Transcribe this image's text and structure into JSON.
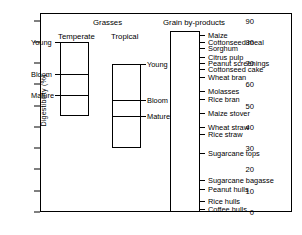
{
  "chart_data": {
    "type": "bar",
    "title": "",
    "xlabel": "",
    "ylabel": "Digestibility  (%)",
    "ylim": [
      0,
      92
    ],
    "yticks": [
      0,
      10,
      20,
      30,
      40,
      50,
      60,
      70,
      80,
      90
    ],
    "ytick_labels": [
      "0",
      "10",
      "20",
      "30",
      "40",
      "50",
      "60",
      "70",
      "80",
      "90"
    ],
    "grid": false,
    "legend": "none",
    "groups": [
      {
        "name": "Grasses",
        "subgroups": [
          {
            "name": "Temperate",
            "range": [
              45,
              80
            ],
            "segments": [
              {
                "label": "Young",
                "from": 65,
                "to": 80
              },
              {
                "label": "Bloom",
                "from": 55,
                "to": 65
              },
              {
                "label": "Mature",
                "from": 45,
                "to": 55
              }
            ]
          },
          {
            "name": "Tropical",
            "range": [
              30,
              69.5
            ],
            "segments": [
              {
                "label": "Young",
                "from": 52.5,
                "to": 69.5
              },
              {
                "label": "Bloom",
                "from": 45,
                "to": 52.5
              },
              {
                "label": "Mature",
                "from": 30,
                "to": 45
              }
            ]
          }
        ]
      },
      {
        "name": "Grain by-products",
        "range": [
          0,
          85
        ],
        "items": [
          {
            "label": "Maize",
            "value": 83
          },
          {
            "label": "Cottonseed meal",
            "value": 80
          },
          {
            "label": "Sorghum",
            "value": 77
          },
          {
            "label": "Citrus pulp",
            "value": 73
          },
          {
            "label": "Peanut screenings",
            "value": 70
          },
          {
            "label": "Cottonseed cake",
            "value": 67
          },
          {
            "label": "Wheat bran",
            "value": 63.5
          },
          {
            "label": "Molasses",
            "value": 57
          },
          {
            "label": "Rice bran",
            "value": 53
          },
          {
            "label": "Maize stover",
            "value": 46.5
          },
          {
            "label": "Wheat straw",
            "value": 40
          },
          {
            "label": "Rice straw",
            "value": 36.5
          },
          {
            "label": "Sugarcane tops",
            "value": 27.5
          },
          {
            "label": "Sugarcane bagasse",
            "value": 15
          },
          {
            "label": "Peanut hulls",
            "value": 11
          },
          {
            "label": "Rice hulls",
            "value": 5
          },
          {
            "label": "Coffee hulls",
            "value": 1.5
          }
        ]
      }
    ]
  }
}
